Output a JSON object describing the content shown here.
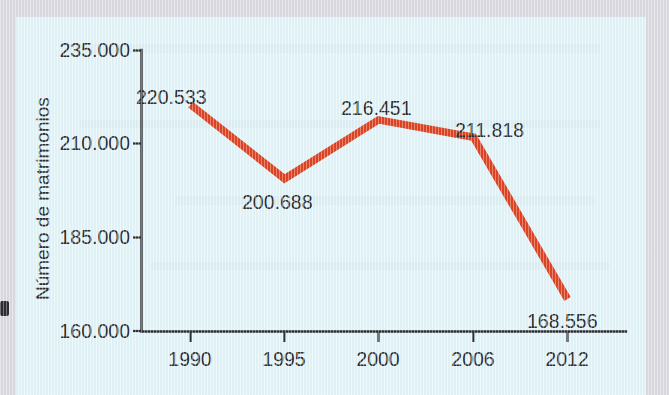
{
  "figure": {
    "background_color": "#e3f5f9",
    "margin_color": "#dcdae2"
  },
  "chart_data": {
    "type": "line",
    "title": "",
    "subtitle": "",
    "xlabel": "",
    "ylabel": "Número de matrimonios",
    "categories": [
      "1990",
      "1995",
      "2000",
      "2006",
      "2012"
    ],
    "values": [
      220533,
      200688,
      216451,
      211818,
      168556
    ],
    "data_labels": [
      "220.533",
      "200.688",
      "216.451",
      "211.818",
      "168.556"
    ],
    "series": [
      {
        "name": "Número de matrimonios",
        "color": "#dd4425",
        "values": [
          220533,
          200688,
          216451,
          211818,
          168556
        ]
      }
    ],
    "ytick_labels": [
      "235.000",
      "210.000",
      "185.000",
      "160.000"
    ],
    "ytick_values": [
      235000,
      210000,
      185000,
      160000
    ],
    "ylim": [
      160000,
      235000
    ],
    "xtick_labels": [
      "1990",
      "1995",
      "2000",
      "2006",
      "2012"
    ],
    "grid": false,
    "legend": false,
    "legend_position": "none",
    "line_color": "#dd4425",
    "text_color": "#2f3033",
    "axis_color": "#2e2f34"
  }
}
